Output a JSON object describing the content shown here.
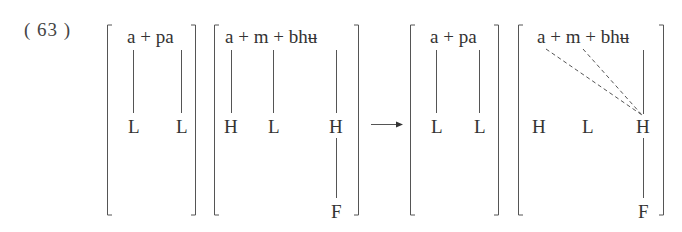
{
  "example": {
    "number_label": "( 63 )"
  },
  "input": {
    "bracket1": {
      "segments": "a + pa",
      "tones": [
        "L",
        "L"
      ]
    },
    "bracket2": {
      "segments": "a + m + bhʉ",
      "tones": [
        "H",
        "L",
        "H"
      ],
      "floating_tone": "F"
    }
  },
  "arrow": {
    "symbol": "→"
  },
  "output": {
    "bracket3": {
      "segments": "a + pa",
      "tones": [
        "L",
        "L"
      ]
    },
    "bracket4": {
      "segments": "a + m + bhʉ",
      "tones": [
        "H",
        "L",
        "H"
      ],
      "floating_tone": "F",
      "dashed_association_to": "H"
    }
  },
  "colors": {
    "ink": "#333333",
    "lines": "#555555"
  }
}
